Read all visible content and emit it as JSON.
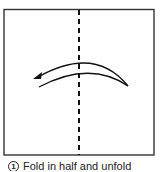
{
  "diagram": {
    "paper": {
      "x": 4,
      "y": 9,
      "width": 150,
      "height": 146,
      "stroke": "#333333",
      "fill": "#ffffff"
    },
    "fold_line": {
      "type": "valley",
      "style": "dashed",
      "x": 79,
      "y1": 9,
      "y2": 155
    },
    "arrow": {
      "direction": "left",
      "description": "fold right half over to left"
    }
  },
  "caption": {
    "step_number": "1",
    "text": "Fold in half and unfold"
  }
}
